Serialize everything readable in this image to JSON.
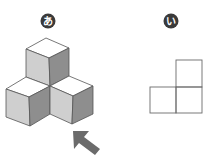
{
  "labels": {
    "figure_a": "あ",
    "figure_b": "い"
  },
  "colors": {
    "label_circle": "#3a3a3a",
    "outline": "#555555",
    "top_face": "#ffffff",
    "left_face": "#cfcfcf",
    "right_face": "#8e8e8e",
    "arrow": "#6b6b6b",
    "grid_line": "#6a6a6a"
  },
  "figure_a": {
    "description": "isometric stack of three cubes (one on top, two below) with view-direction arrow",
    "cube_count": 3,
    "arrow_direction": "up-left"
  },
  "figure_b": {
    "description": "projection view: L-shaped arrangement of three squares",
    "square_count": 3
  }
}
